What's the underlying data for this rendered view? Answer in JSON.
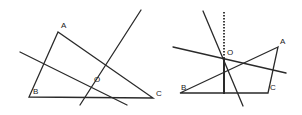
{
  "figures": [
    {
      "name": "triangle-left",
      "vertices": {
        "A": {
          "x": 58,
          "y": 32,
          "label": "A",
          "lx": 61,
          "ly": 28
        },
        "B": {
          "x": 29,
          "y": 97,
          "label": "B",
          "lx": 33,
          "ly": 94
        },
        "C": {
          "x": 153,
          "y": 98,
          "label": "C",
          "lx": 156,
          "ly": 96
        }
      },
      "center_label": {
        "text": "O",
        "x": 94,
        "y": 82
      },
      "lines": [
        {
          "x1": 20,
          "y1": 52,
          "x2": 127,
          "y2": 105
        },
        {
          "x1": 80,
          "y1": 105,
          "x2": 141,
          "y2": 10
        }
      ]
    },
    {
      "name": "triangle-right",
      "vertices": {
        "A": {
          "x": 278,
          "y": 47,
          "label": "A",
          "lx": 280,
          "ly": 44
        },
        "B": {
          "x": 180,
          "y": 93,
          "label": "B",
          "lx": 181,
          "ly": 90
        },
        "C": {
          "x": 268,
          "y": 93,
          "label": "C",
          "lx": 270,
          "ly": 90
        }
      },
      "center_label": {
        "text": "O",
        "x": 227,
        "y": 55
      },
      "lines": [
        {
          "x1": 173,
          "y1": 47,
          "x2": 286,
          "y2": 73
        },
        {
          "x1": 203,
          "y1": 11,
          "x2": 243,
          "y2": 106
        }
      ],
      "altitude": {
        "x": 224,
        "y_top": 12,
        "y_mid": 58,
        "y_bottom": 94
      }
    }
  ],
  "labels": {
    "left_A": "A",
    "left_B": "B",
    "left_C": "C",
    "left_O": "O",
    "right_A": "A",
    "right_B": "B",
    "right_C": "C",
    "right_O": "O"
  }
}
